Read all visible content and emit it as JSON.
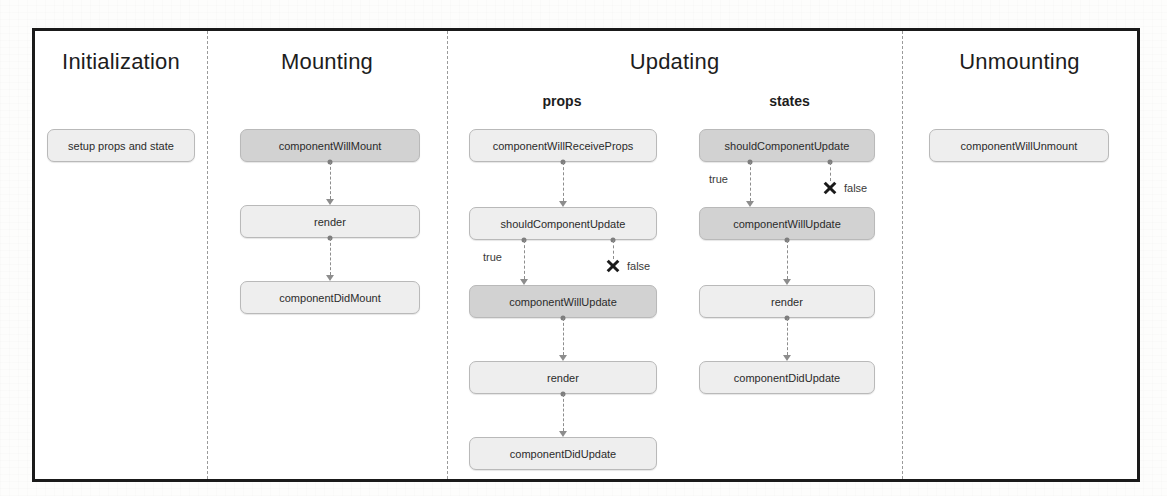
{
  "figure": {
    "colors": {
      "frame_border": "#1a1a1a",
      "divider": "#9a9a9a",
      "node_dark": "#d2d2d2",
      "node_light": "#eeeeee",
      "node_border": "#b9b9b9",
      "connector": "#8d8d8d",
      "text": "#2b2b2b",
      "terminator": "#1a1a1a"
    }
  },
  "phases": [
    {
      "key": "initialization",
      "title": "Initialization",
      "nodes": [
        {
          "label": "setup props and state",
          "shade": "light"
        }
      ]
    },
    {
      "key": "mounting",
      "title": "Mounting",
      "nodes": [
        {
          "label": "componentWillMount",
          "shade": "dark"
        },
        {
          "label": "render",
          "shade": "light"
        },
        {
          "label": "componentDidMount",
          "shade": "light"
        }
      ]
    },
    {
      "key": "updating",
      "title": "Updating",
      "lanes": [
        {
          "key": "props",
          "title": "props",
          "nodes": [
            {
              "label": "componentWillReceiveProps",
              "shade": "light"
            },
            {
              "label": "shouldComponentUpdate",
              "shade": "light"
            },
            {
              "label": "componentWillUpdate",
              "shade": "dark"
            },
            {
              "label": "render",
              "shade": "light"
            },
            {
              "label": "componentDidUpdate",
              "shade": "light"
            }
          ],
          "branch": {
            "true_label": "true",
            "false_label": "false"
          }
        },
        {
          "key": "states",
          "title": "states",
          "nodes": [
            {
              "label": "shouldComponentUpdate",
              "shade": "dark"
            },
            {
              "label": "componentWillUpdate",
              "shade": "dark"
            },
            {
              "label": "render",
              "shade": "light"
            },
            {
              "label": "componentDidUpdate",
              "shade": "light"
            }
          ],
          "branch": {
            "true_label": "true",
            "false_label": "false"
          }
        }
      ]
    },
    {
      "key": "unmounting",
      "title": "Unmounting",
      "nodes": [
        {
          "label": "componentWillUnmount",
          "shade": "light"
        }
      ]
    }
  ]
}
